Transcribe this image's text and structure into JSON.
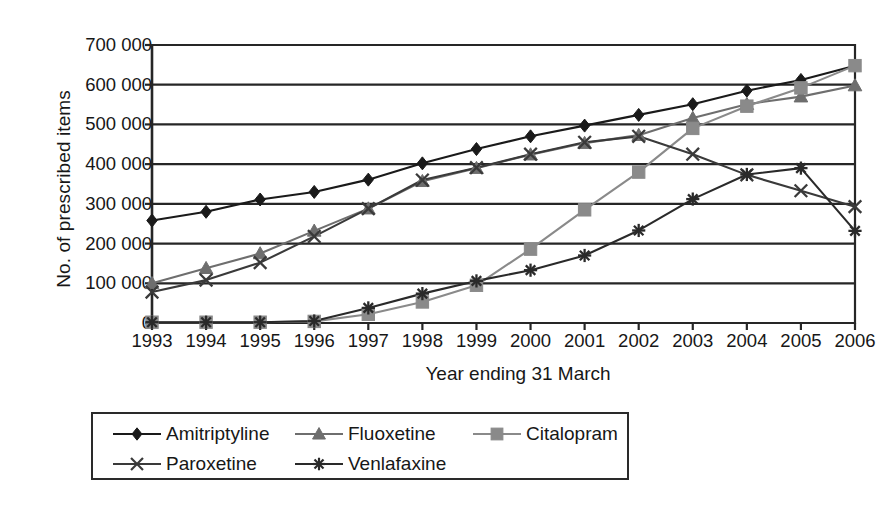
{
  "chart_data": {
    "type": "line",
    "title": "",
    "xlabel": "Year ending 31 March",
    "ylabel": "No. of prescribed items",
    "categories": [
      "1993",
      "1994",
      "1995",
      "1996",
      "1997",
      "1998",
      "1999",
      "2000",
      "2001",
      "2002",
      "2003",
      "2004",
      "2005",
      "2006"
    ],
    "ylim": [
      0,
      700000
    ],
    "yticks": [
      0,
      100000,
      200000,
      300000,
      400000,
      500000,
      600000,
      700000
    ],
    "ytick_labels": [
      "0",
      "100 000",
      "200 000",
      "300 000",
      "400 000",
      "500 000",
      "600 000",
      "700 000"
    ],
    "grid": "horizontal",
    "legend_position": "bottom",
    "series": [
      {
        "name": "Amitriptyline",
        "marker": "diamond",
        "color": "#1a1a1a",
        "values": [
          258000,
          280000,
          311000,
          330000,
          361000,
          402000,
          438000,
          470000,
          497000,
          524000,
          551000,
          585000,
          612000,
          648000
        ]
      },
      {
        "name": "Fluoxetine",
        "marker": "triangle",
        "color": "#6e6e6e",
        "values": [
          100000,
          138000,
          175000,
          232000,
          288000,
          357000,
          390000,
          424000,
          453000,
          473000,
          516000,
          551000,
          570000,
          598000
        ]
      },
      {
        "name": "Citalopram",
        "marker": "square",
        "color": "#8a8a8a",
        "values": [
          2000,
          2000,
          2000,
          4000,
          22000,
          53000,
          95000,
          186000,
          285000,
          380000,
          490000,
          546000,
          592000,
          648000
        ]
      },
      {
        "name": "Paroxetine",
        "marker": "x",
        "color": "#3a3a3a",
        "values": [
          78000,
          108000,
          152000,
          218000,
          288000,
          360000,
          391000,
          425000,
          455000,
          470000,
          425000,
          373000,
          333000,
          293000
        ]
      },
      {
        "name": "Venlafaxine",
        "marker": "asterisk",
        "color": "#2a2a2a",
        "values": [
          2000,
          2000,
          2000,
          5000,
          38000,
          74000,
          106000,
          133000,
          170000,
          233000,
          312000,
          374000,
          390000,
          232000
        ]
      }
    ]
  },
  "legend": {
    "items": [
      {
        "label": "Amitriptyline"
      },
      {
        "label": "Fluoxetine"
      },
      {
        "label": "Citalopram"
      },
      {
        "label": "Paroxetine"
      },
      {
        "label": "Venlafaxine"
      }
    ]
  }
}
